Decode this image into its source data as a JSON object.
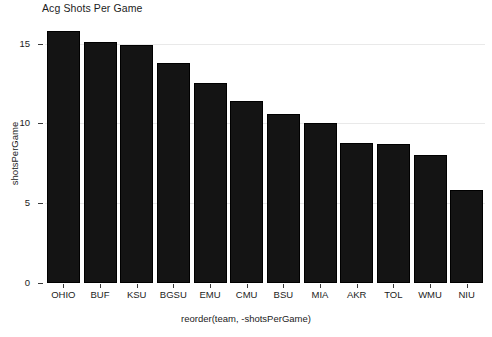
{
  "chart_data": {
    "type": "bar",
    "title": "Acg Shots Per Game",
    "xlabel": "reorder(team, -shotsPerGame)",
    "ylabel": "shotsPerGame",
    "categories": [
      "OHIO",
      "BUF",
      "KSU",
      "BGSU",
      "EMU",
      "CMU",
      "BSU",
      "MIA",
      "AKR",
      "TOL",
      "WMU",
      "NIU"
    ],
    "values": [
      15.8,
      15.1,
      14.9,
      13.8,
      12.5,
      11.4,
      10.6,
      10.0,
      8.8,
      8.7,
      8.0,
      5.8
    ],
    "ylim": [
      0,
      16.6
    ],
    "yticks": [
      0,
      5,
      10,
      15
    ],
    "ytick_labels": [
      "0",
      "5",
      "10",
      "15"
    ],
    "grid": true,
    "grid_color": "#e9e9e9",
    "legend": null,
    "bar_color": "#141414",
    "bar_edge_color": "#000000",
    "background": "#ffffff"
  }
}
